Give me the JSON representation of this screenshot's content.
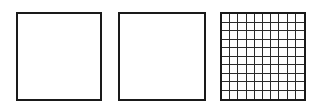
{
  "diagram": {
    "squares": [
      {
        "id": "square-1",
        "type": "empty",
        "rows": 0,
        "cols": 0
      },
      {
        "id": "square-2",
        "type": "empty",
        "rows": 0,
        "cols": 0
      },
      {
        "id": "square-3",
        "type": "grid",
        "rows": 10,
        "cols": 10
      }
    ],
    "stroke_color": "#1a1a1a",
    "background": "#ffffff"
  }
}
